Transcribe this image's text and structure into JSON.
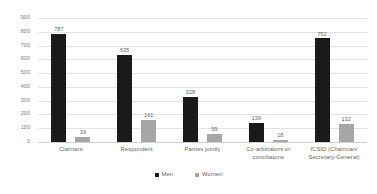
{
  "chart_data": {
    "type": "bar",
    "title": "",
    "subtitle": "",
    "xlabel": "",
    "ylabel": "",
    "ylim": [
      0,
      900
    ],
    "ytick_step": 100,
    "yticks": [
      "900",
      "800",
      "700",
      "600",
      "500",
      "400",
      "300",
      "200",
      "100",
      "0"
    ],
    "grid": true,
    "legend_position": "bottom-center",
    "categories": [
      "Claimant",
      "Respondent",
      "Parties jointly",
      "Co-arbitrators or conciliatons",
      "ICSID (Chairman/ Secretary-General)"
    ],
    "series": [
      {
        "name": "Men",
        "color": "#1a1a1a",
        "values": [
          787,
          635,
          328,
          139,
          752
        ],
        "labels": [
          "787",
          "635",
          "328",
          "139",
          "752"
        ]
      },
      {
        "name": "Women",
        "color": "#a6a6a6",
        "values": [
          39,
          161,
          59,
          18,
          132
        ],
        "labels": [
          "39",
          "161",
          "59",
          "18",
          "132"
        ]
      }
    ]
  },
  "legend": {
    "items": [
      {
        "label": "Men",
        "color": "#1a1a1a",
        "marker": "square-marker"
      },
      {
        "label": "Women",
        "color": "#a6a6a6",
        "marker": "square-marker"
      }
    ]
  },
  "colors": {
    "men": "#1a1a1a",
    "women": "#a6a6a6",
    "gridline": "#e3e3e3",
    "text": "#5f5f5f",
    "background": "#ffffff"
  }
}
